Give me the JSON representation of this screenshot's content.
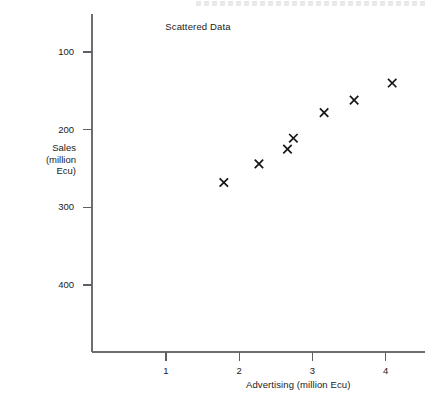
{
  "figure": {
    "title": "Scattered Data",
    "background_color": "#ffffff",
    "axis_color": "#6e6e72",
    "marker_color": "#161616"
  },
  "axes": {
    "x_title": "Advertising (million Ecu)",
    "y_title_lines": [
      "Sales",
      "(million",
      "Ecu)"
    ],
    "x_tick_labels": [
      "1",
      "2",
      "3",
      "4"
    ],
    "y_tick_labels": [
      "400",
      "300",
      "200",
      "100"
    ]
  },
  "chart_data": {
    "type": "scatter",
    "title": "Scattered Data",
    "xlabel": "Advertising (million Ecu)",
    "ylabel": "Sales (million Ecu)",
    "grid": false,
    "legend": false,
    "marker": "x",
    "xlim": [
      0,
      4.55
    ],
    "ylim": [
      0,
      438
    ],
    "xticks": [
      1,
      2,
      3,
      4
    ],
    "yticks": [
      100,
      200,
      300,
      400
    ],
    "points": [
      {
        "x": 1.79,
        "y": 232
      },
      {
        "x": 2.27,
        "y": 256
      },
      {
        "x": 2.66,
        "y": 275
      },
      {
        "x": 2.74,
        "y": 289
      },
      {
        "x": 3.16,
        "y": 322
      },
      {
        "x": 3.57,
        "y": 338
      },
      {
        "x": 4.09,
        "y": 360
      }
    ],
    "x": [
      1.79,
      2.27,
      2.66,
      2.74,
      3.16,
      3.57,
      4.09
    ],
    "y": [
      232,
      256,
      275,
      289,
      322,
      338,
      360
    ]
  }
}
